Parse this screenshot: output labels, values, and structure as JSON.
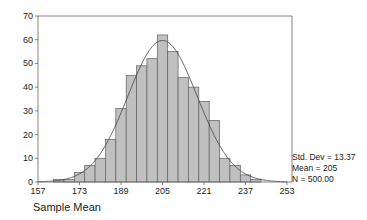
{
  "chart_data": {
    "type": "bar",
    "subtype": "histogram-with-normal-curve",
    "title": "",
    "xlabel": "Sample Mean",
    "ylabel": "",
    "bin_width": 4,
    "bins": [
      {
        "start": 159,
        "end": 163,
        "count": 0
      },
      {
        "start": 163,
        "end": 167,
        "count": 1
      },
      {
        "start": 167,
        "end": 171,
        "count": 1
      },
      {
        "start": 171,
        "end": 175,
        "count": 4
      },
      {
        "start": 175,
        "end": 179,
        "count": 7
      },
      {
        "start": 179,
        "end": 183,
        "count": 10
      },
      {
        "start": 183,
        "end": 187,
        "count": 18
      },
      {
        "start": 187,
        "end": 191,
        "count": 31
      },
      {
        "start": 191,
        "end": 195,
        "count": 45
      },
      {
        "start": 195,
        "end": 199,
        "count": 49
      },
      {
        "start": 199,
        "end": 203,
        "count": 52
      },
      {
        "start": 203,
        "end": 207,
        "count": 62
      },
      {
        "start": 207,
        "end": 211,
        "count": 55
      },
      {
        "start": 211,
        "end": 215,
        "count": 44
      },
      {
        "start": 215,
        "end": 219,
        "count": 40
      },
      {
        "start": 219,
        "end": 223,
        "count": 34
      },
      {
        "start": 223,
        "end": 227,
        "count": 26
      },
      {
        "start": 227,
        "end": 231,
        "count": 10
      },
      {
        "start": 231,
        "end": 235,
        "count": 7
      },
      {
        "start": 235,
        "end": 239,
        "count": 3
      },
      {
        "start": 239,
        "end": 243,
        "count": 1
      }
    ],
    "x_ticks": [
      157,
      173,
      189,
      205,
      221,
      237,
      253
    ],
    "y_ticks": [
      0,
      10,
      20,
      30,
      40,
      50,
      60,
      70
    ],
    "xlim": [
      157,
      253
    ],
    "ylim": [
      0,
      70
    ],
    "grid": false,
    "overlay": {
      "type": "normal-curve",
      "mean": 205,
      "std_dev": 13.37,
      "n": 500
    },
    "stats": {
      "std_dev": "Std. Dev = 13.37",
      "mean": "Mean = 205",
      "n": "N = 500.00"
    },
    "colors": {
      "bar_fill": "#c0c0c0",
      "bar_stroke": "#606060",
      "curve": "#444444",
      "axis": "#444444"
    }
  }
}
